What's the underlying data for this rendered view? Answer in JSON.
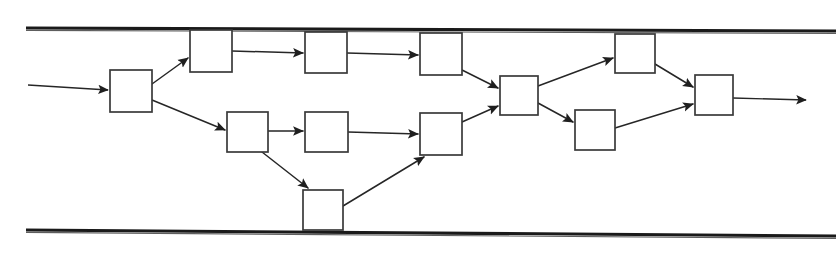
{
  "figure": {
    "kind": "flow-diagram",
    "background_color": "#ffffff",
    "line_color": "#262626",
    "box_fill": "#ffffff",
    "box_stroke": "#3a3a3a",
    "width": 840,
    "height": 264
  },
  "rails": [
    {
      "id": "rail-top",
      "name": "top-boundary-rail",
      "x1": 26,
      "y1": 28,
      "x2": 836,
      "y2": 31,
      "thickness": 3.1,
      "label": ""
    },
    {
      "id": "rail-bottom",
      "name": "bottom-boundary-rail",
      "x1": 26,
      "y1": 230,
      "x2": 836,
      "y2": 236,
      "thickness": 3.1,
      "label": ""
    }
  ],
  "nodes": [
    {
      "id": "n1",
      "name": "node-entry",
      "x": 110,
      "y": 70,
      "w": 42,
      "h": 42,
      "label": ""
    },
    {
      "id": "n2",
      "name": "node-top-1",
      "x": 190,
      "y": 30,
      "w": 42,
      "h": 42,
      "label": ""
    },
    {
      "id": "n3",
      "name": "node-top-2",
      "x": 305,
      "y": 32,
      "w": 42,
      "h": 41,
      "label": ""
    },
    {
      "id": "n4",
      "name": "node-top-3",
      "x": 420,
      "y": 33,
      "w": 42,
      "h": 42,
      "label": ""
    },
    {
      "id": "n5",
      "name": "node-mid-1",
      "x": 227,
      "y": 112,
      "w": 41,
      "h": 40,
      "label": ""
    },
    {
      "id": "n6",
      "name": "node-mid-2",
      "x": 305,
      "y": 112,
      "w": 43,
      "h": 40,
      "label": ""
    },
    {
      "id": "n7",
      "name": "node-bottom-detour",
      "x": 303,
      "y": 190,
      "w": 40,
      "h": 40,
      "label": ""
    },
    {
      "id": "n8",
      "name": "node-mid-merge",
      "x": 420,
      "y": 113,
      "w": 42,
      "h": 42,
      "label": ""
    },
    {
      "id": "n9",
      "name": "node-hub",
      "x": 500,
      "y": 76,
      "w": 38,
      "h": 39,
      "label": ""
    },
    {
      "id": "n10",
      "name": "node-upper-right",
      "x": 615,
      "y": 34,
      "w": 40,
      "h": 39,
      "label": ""
    },
    {
      "id": "n11",
      "name": "node-lower-right",
      "x": 575,
      "y": 110,
      "w": 40,
      "h": 40,
      "label": ""
    },
    {
      "id": "n12",
      "name": "node-exit",
      "x": 695,
      "y": 75,
      "w": 38,
      "h": 40,
      "label": ""
    }
  ],
  "edges": [
    {
      "id": "e-in",
      "name": "edge-input-to-entry",
      "from": "input",
      "to": "n1",
      "x1": 28,
      "y1": 85,
      "x2": 108,
      "y2": 90,
      "arrow": true
    },
    {
      "id": "e1",
      "name": "edge-entry-to-top1",
      "from": "n1",
      "to": "n2",
      "x1": 152,
      "y1": 84,
      "x2": 188,
      "y2": 58,
      "arrow": true
    },
    {
      "id": "e2",
      "name": "edge-entry-to-mid1",
      "from": "n1",
      "to": "n5",
      "x1": 152,
      "y1": 100,
      "x2": 225,
      "y2": 130,
      "arrow": true
    },
    {
      "id": "e3",
      "name": "edge-top1-to-top2",
      "from": "n2",
      "to": "n3",
      "x1": 232,
      "y1": 51,
      "x2": 303,
      "y2": 53,
      "arrow": true
    },
    {
      "id": "e4",
      "name": "edge-top2-to-top3",
      "from": "n3",
      "to": "n4",
      "x1": 347,
      "y1": 53,
      "x2": 418,
      "y2": 55,
      "arrow": true
    },
    {
      "id": "e5",
      "name": "edge-mid1-to-mid2",
      "from": "n5",
      "to": "n6",
      "x1": 268,
      "y1": 131,
      "x2": 303,
      "y2": 131,
      "arrow": true
    },
    {
      "id": "e6",
      "name": "edge-mid1-to-detour",
      "from": "n5",
      "to": "n7",
      "x1": 262,
      "y1": 152,
      "x2": 308,
      "y2": 188,
      "arrow": true
    },
    {
      "id": "e7",
      "name": "edge-mid2-to-merge",
      "from": "n6",
      "to": "n8",
      "x1": 348,
      "y1": 132,
      "x2": 418,
      "y2": 134,
      "arrow": true
    },
    {
      "id": "e8",
      "name": "edge-detour-to-merge",
      "from": "n7",
      "to": "n8",
      "x1": 343,
      "y1": 206,
      "x2": 424,
      "y2": 157,
      "arrow": true
    },
    {
      "id": "e9",
      "name": "edge-top3-to-hub",
      "from": "n4",
      "to": "n9",
      "x1": 462,
      "y1": 70,
      "x2": 498,
      "y2": 88,
      "arrow": true
    },
    {
      "id": "e10",
      "name": "edge-merge-to-hub",
      "from": "n8",
      "to": "n9",
      "x1": 462,
      "y1": 122,
      "x2": 498,
      "y2": 106,
      "arrow": true
    },
    {
      "id": "e11",
      "name": "edge-hub-to-upper-right",
      "from": "n9",
      "to": "n10",
      "x1": 538,
      "y1": 86,
      "x2": 613,
      "y2": 58,
      "arrow": true
    },
    {
      "id": "e12",
      "name": "edge-hub-to-lower-right",
      "from": "n9",
      "to": "n11",
      "x1": 538,
      "y1": 103,
      "x2": 573,
      "y2": 122,
      "arrow": true
    },
    {
      "id": "e13",
      "name": "edge-upper-right-to-exit",
      "from": "n10",
      "to": "n12",
      "x1": 655,
      "y1": 64,
      "x2": 693,
      "y2": 87,
      "arrow": true
    },
    {
      "id": "e14",
      "name": "edge-lower-right-to-exit",
      "from": "n11",
      "to": "n12",
      "x1": 615,
      "y1": 128,
      "x2": 693,
      "y2": 104,
      "arrow": true
    },
    {
      "id": "e-out",
      "name": "edge-exit-to-output",
      "from": "n12",
      "to": "output",
      "x1": 733,
      "y1": 98,
      "x2": 806,
      "y2": 100,
      "arrow": true
    }
  ]
}
